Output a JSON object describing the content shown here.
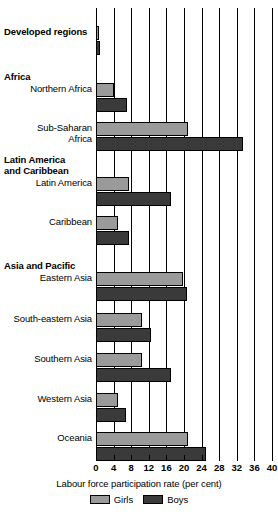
{
  "chart_data": {
    "type": "bar",
    "orientation": "horizontal",
    "title": "",
    "xlabel": "Labour force participation rate (per cent)",
    "ylabel": "",
    "xlim": [
      0,
      40
    ],
    "xticks": [
      0,
      4,
      8,
      12,
      16,
      20,
      24,
      28,
      32,
      36,
      40
    ],
    "grid": true,
    "legend_position": "bottom",
    "categories": [
      "Developed regions",
      "Northern Africa",
      "Sub-Saharan Africa",
      "Latin America",
      "Caribbean",
      "Eastern Asia",
      "South-eastern Asia",
      "Southern Asia",
      "Western Asia",
      "Oceania"
    ],
    "group_headings": [
      "Africa",
      "Latin America and Caribbean",
      "Asia and Pacific"
    ],
    "series": [
      {
        "name": "Girls",
        "color": "#9a9a9a",
        "values": [
          0.6,
          4.0,
          21.0,
          7.5,
          5.0,
          19.8,
          10.5,
          10.5,
          5.0,
          21.0
        ]
      },
      {
        "name": "Boys",
        "color": "#3a3a3a",
        "values": [
          0.9,
          7.0,
          33.5,
          17.0,
          7.5,
          20.7,
          12.5,
          17.0,
          6.8,
          25.0
        ]
      }
    ]
  },
  "labels": {
    "developed_regions": "Developed regions",
    "africa": "Africa",
    "northern_africa": "Northern Africa",
    "sub_saharan_line1": "Sub-Saharan",
    "sub_saharan_line2": "Africa",
    "lac_line1": "Latin America",
    "lac_line2": "and Caribbean",
    "latin_america": "Latin America",
    "caribbean": "Caribbean",
    "asia_pacific": "Asia and Pacific",
    "eastern_asia": "Eastern Asia",
    "south_eastern_asia": "South-eastern Asia",
    "southern_asia": "Southern Asia",
    "western_asia": "Western Asia",
    "oceania": "Oceania"
  },
  "axis": {
    "title": "Labour force participation rate (per cent)",
    "ticks": [
      "0",
      "4",
      "8",
      "12",
      "16",
      "20",
      "24",
      "28",
      "32",
      "36",
      "40"
    ]
  },
  "legend": {
    "girls_label": "Girls",
    "boys_label": "Boys",
    "girls_color": "#9a9a9a",
    "boys_color": "#3a3a3a"
  }
}
